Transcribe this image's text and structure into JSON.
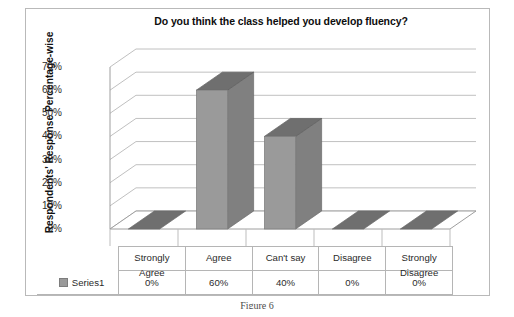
{
  "chart_data": {
    "type": "bar",
    "title": "Do you think the class helped you develop fluency?",
    "xlabel": "",
    "ylabel": "Respondents' Response Percentage-wise",
    "categories": [
      "Strongly Agree",
      "Agree",
      "Can't say",
      "Disagree",
      "Strongly Disagree"
    ],
    "values": [
      0,
      60,
      40,
      0,
      0
    ],
    "value_labels": [
      "0%",
      "60%",
      "40%",
      "0%",
      "0%"
    ],
    "series": [
      {
        "name": "Series1",
        "values": [
          0,
          60,
          40,
          0,
          0
        ]
      }
    ],
    "ylim": [
      0,
      70
    ],
    "ytick_values": [
      0,
      10,
      20,
      30,
      40,
      50,
      60,
      70
    ],
    "ytick_labels": [
      "0%",
      "10%",
      "20%",
      "30%",
      "40%",
      "50%",
      "60%",
      "70%"
    ],
    "grid": true,
    "legend_position": "bottom-left-table",
    "style": "3d-column",
    "colors": {
      "bar_front": "#9a9a9a",
      "bar_top": "#6f6f6f",
      "bar_side": "#808080",
      "gridline": "#c0c0c0",
      "axis": "#9e9e9e",
      "frame": "#b9b9b9",
      "text": "#2b2b2b",
      "title": "#0d0d0d"
    }
  },
  "legend": {
    "series_label": "Series1"
  },
  "table": {
    "header_note": ""
  },
  "caption": {
    "text": "Figure 6"
  }
}
